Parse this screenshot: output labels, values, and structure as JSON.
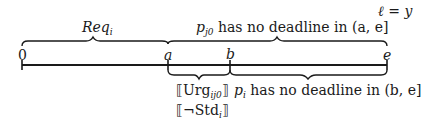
{
  "diagram": {
    "timeline": {
      "ticks": [
        {
          "label": "0",
          "x": 22
        },
        {
          "label": "a",
          "x": 168
        },
        {
          "label": "b",
          "x": 230
        },
        {
          "label": "e",
          "x": 387
        }
      ]
    },
    "top_braces": [
      {
        "label_main": "Req",
        "label_sub": "i",
        "span": "0 to a"
      },
      {
        "label_main": "p",
        "label_sub": "j0",
        "label_rest": " has no deadline in (a, e]",
        "span": "a to e"
      }
    ],
    "top_annotation": "ℓ = y",
    "bottom_braces": [
      {
        "lines": [
          {
            "main": "⟦Urg",
            "sub": "ij0",
            "end": "⟧"
          },
          {
            "main": "⟦¬Std",
            "sub": "i",
            "end": "⟧"
          }
        ],
        "span": "a to b"
      },
      {
        "label_main": "p",
        "label_sub": "i",
        "label_rest": " has no deadline in (b, e]",
        "span": "b to e"
      }
    ]
  }
}
